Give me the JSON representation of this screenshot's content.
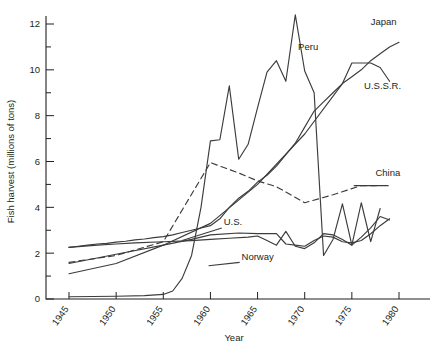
{
  "chart_data": {
    "type": "line",
    "title": "",
    "xlabel": "Year",
    "ylabel": "Fish harvest  (millions of tons)",
    "xlim": [
      1943,
      1982
    ],
    "ylim": [
      0,
      12.7
    ],
    "xticks": [
      1945,
      1950,
      1955,
      1960,
      1965,
      1970,
      1975,
      1980
    ],
    "xticklabels": [
      "1945",
      "1950",
      "1955",
      "1960",
      "1965",
      "1970",
      "1975",
      "1980"
    ],
    "yticks": [
      0,
      2,
      4,
      6,
      8,
      10,
      12
    ],
    "yticklabels": [
      "0",
      "2",
      "4",
      "6",
      "8",
      "10",
      "12"
    ],
    "yminorticks": [
      1,
      3,
      5,
      7,
      9,
      11
    ],
    "grid": false,
    "legend_position": "inline-labels",
    "series": [
      {
        "name": "Japan",
        "style": "solid",
        "label_x": 1977.0,
        "label_y": 11.95,
        "x": [
          1945,
          1946,
          1947,
          1948,
          1949,
          1950,
          1951,
          1952,
          1953,
          1954,
          1955,
          1956,
          1957,
          1958,
          1959,
          1960,
          1961,
          1962,
          1963,
          1964,
          1965,
          1966,
          1967,
          1968,
          1969,
          1970,
          1971,
          1972,
          1973,
          1974,
          1975,
          1976,
          1977,
          1978,
          1979,
          1980
        ],
        "values": [
          2.25,
          2.3,
          2.35,
          2.4,
          2.43,
          2.48,
          2.52,
          2.58,
          2.62,
          2.68,
          2.72,
          2.8,
          2.9,
          3.0,
          3.1,
          3.2,
          3.5,
          4.0,
          4.4,
          4.7,
          5.1,
          5.4,
          5.8,
          6.3,
          6.8,
          7.5,
          8.2,
          8.6,
          9.0,
          9.4,
          9.7,
          10.0,
          10.4,
          10.7,
          11.0,
          11.2
        ]
      },
      {
        "name": "U.S.S.R.",
        "style": "solid",
        "label_x": 1976.3,
        "label_y": 9.15,
        "x": [
          1945,
          1950,
          1955,
          1960,
          1965,
          1970,
          1974,
          1975,
          1976,
          1977,
          1978,
          1979
        ],
        "values": [
          1.1,
          1.55,
          2.35,
          3.3,
          5.0,
          7.2,
          9.4,
          10.3,
          10.3,
          10.3,
          10.1,
          9.5
        ]
      },
      {
        "name": "Peru",
        "style": "solid",
        "label_x": 1969.3,
        "label_y": 10.85,
        "x": [
          1945,
          1950,
          1953,
          1955,
          1956,
          1957,
          1958,
          1959,
          1960,
          1961,
          1962,
          1963,
          1964,
          1965,
          1966,
          1967,
          1968,
          1969,
          1970,
          1971,
          1972,
          1973,
          1974,
          1975,
          1976,
          1977,
          1978
        ],
        "values": [
          0.1,
          0.12,
          0.15,
          0.2,
          0.35,
          0.9,
          1.9,
          4.0,
          6.9,
          6.95,
          9.3,
          6.1,
          6.75,
          8.35,
          9.9,
          10.4,
          9.5,
          12.4,
          9.95,
          9.0,
          1.9,
          2.6,
          4.15,
          2.35,
          4.2,
          2.5,
          3.95
        ]
      },
      {
        "name": "China",
        "style": "dashed",
        "label_x": 1977.5,
        "label_y": 5.35,
        "x": [
          1945,
          1950,
          1955,
          1960,
          1963,
          1965,
          1967,
          1970,
          1973,
          1976,
          1978
        ],
        "values": [
          1.6,
          1.9,
          2.5,
          5.95,
          5.5,
          5.15,
          4.9,
          4.2,
          4.55,
          4.95,
          4.95
        ]
      },
      {
        "name": "U.S.",
        "style": "solid",
        "label_x": 1961.4,
        "label_y": 3.25,
        "x": [
          1945,
          1950,
          1955,
          1958,
          1960,
          1963,
          1965,
          1967,
          1968,
          1969,
          1970,
          1971,
          1972,
          1973,
          1974,
          1975,
          1976,
          1977,
          1978,
          1979
        ],
        "values": [
          1.55,
          1.95,
          2.35,
          2.6,
          2.8,
          2.88,
          2.85,
          2.85,
          2.4,
          2.35,
          2.3,
          2.55,
          2.75,
          2.7,
          2.5,
          2.45,
          2.55,
          2.85,
          3.2,
          3.5
        ]
      },
      {
        "name": "Norway",
        "style": "solid",
        "label_x": 1963.3,
        "label_y": 1.72,
        "x": [
          1945,
          1948,
          1950,
          1952,
          1955,
          1958,
          1960,
          1962,
          1964,
          1965,
          1966,
          1967,
          1968,
          1969,
          1970,
          1971,
          1972,
          1973,
          1974,
          1975,
          1976,
          1977,
          1978,
          1979
        ],
        "values": [
          2.25,
          2.35,
          2.4,
          2.45,
          2.5,
          2.55,
          2.6,
          2.65,
          2.7,
          2.75,
          2.55,
          2.35,
          2.95,
          2.3,
          2.2,
          2.45,
          2.85,
          2.8,
          2.6,
          2.35,
          2.7,
          3.1,
          3.6,
          3.45
        ]
      }
    ]
  }
}
